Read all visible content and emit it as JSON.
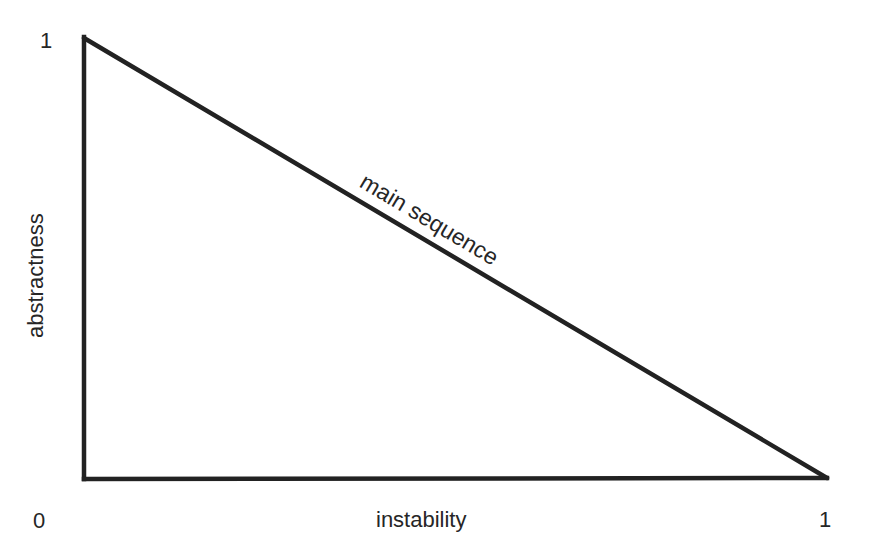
{
  "diagram": {
    "type": "main-sequence-diagram",
    "stroke_color": "#222222",
    "background": "#ffffff",
    "shape": "right-triangle",
    "vertices": [
      {
        "x": 0,
        "y": 1
      },
      {
        "x": 0,
        "y": 0
      },
      {
        "x": 1,
        "y": 0
      }
    ],
    "x_axis": {
      "label": "instability",
      "min_label": "0",
      "max_label": "1"
    },
    "y_axis": {
      "label": "abstractness",
      "max_label": "1"
    },
    "line_label": "main sequence"
  }
}
